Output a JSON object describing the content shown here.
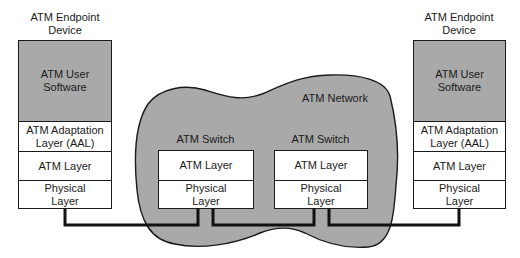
{
  "diagram": {
    "type": "protocol-stack",
    "colors": {
      "shaded": "#a9a9a9",
      "line": "#1a1a1a",
      "background": "#ffffff"
    },
    "network": {
      "label": "ATM Network"
    },
    "left_device": {
      "title_line1": "ATM Endpoint",
      "title_line2": "Device",
      "layers": {
        "user_software_1": "ATM User",
        "user_software_2": "Software",
        "aal_1": "ATM Adaptation",
        "aal_2": "Layer (AAL)",
        "atm": "ATM Layer",
        "physical_1": "Physical",
        "physical_2": "Layer"
      }
    },
    "switch_1": {
      "title": "ATM Switch",
      "layers": {
        "atm": "ATM Layer",
        "physical_1": "Physical",
        "physical_2": "Layer"
      }
    },
    "switch_2": {
      "title": "ATM Switch",
      "layers": {
        "atm": "ATM Layer",
        "physical_1": "Physical",
        "physical_2": "Layer"
      }
    },
    "right_device": {
      "title_line1": "ATM Endpoint",
      "title_line2": "Device",
      "layers": {
        "user_software_1": "ATM User",
        "user_software_2": "Software",
        "aal_1": "ATM Adaptation",
        "aal_2": "Layer (AAL)",
        "atm": "ATM Layer",
        "physical_1": "Physical",
        "physical_2": "Layer"
      }
    },
    "links": [
      {
        "from": "left_device.physical",
        "to": "switch_1.physical"
      },
      {
        "from": "switch_1.physical",
        "to": "switch_2.physical"
      },
      {
        "from": "switch_2.physical",
        "to": "right_device.physical"
      }
    ]
  }
}
